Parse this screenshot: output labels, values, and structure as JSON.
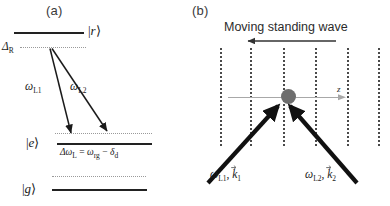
{
  "figure": {
    "width": 390,
    "height": 206,
    "background": "#ffffff"
  },
  "panel_a": {
    "label": "(a)",
    "levels": [
      {
        "name": "rydberg-level",
        "ket": "|r⟩",
        "ket_symbol": "r",
        "type": "solid"
      },
      {
        "name": "excited-level",
        "ket": "|e⟩",
        "ket_symbol": "e",
        "type": "solid"
      },
      {
        "name": "ground-level",
        "ket": "|g⟩",
        "ket_symbol": "g",
        "type": "solid"
      }
    ],
    "detuning_label": "Δ",
    "detuning_sub": "R",
    "laser1_label": "ω",
    "laser1_sub": "L1",
    "laser2_label": "ω",
    "laser2_sub": "L2",
    "two_photon_condition": "Δωʟ = ωᵣ₵ − δᵈ",
    "two_photon_parts": {
      "delta_omega": "Δω",
      "delta_omega_sub": "L",
      "equals": "=",
      "omega_rg": "ω",
      "omega_rg_sub": "rg",
      "minus": "−",
      "delta_d": "δ",
      "delta_d_sub": "d"
    },
    "colors": {
      "level_solid": "#222222",
      "level_dotted": "#9a9a9a",
      "arrow": "#1a1a1a"
    }
  },
  "panel_b": {
    "label": "(b)",
    "title": "Moving standing wave",
    "direction_arrow": "left",
    "axis_label": "z",
    "beam1_omega": "ω",
    "beam1_omega_sub": "L1",
    "beam1_k": "k",
    "beam1_k_sub": "1",
    "beam2_omega": "ω",
    "beam2_omega_sub": "L2",
    "beam2_k": "k",
    "beam2_k_sub": "2",
    "num_wave_nodes": 6,
    "colors": {
      "node_dots": "#4a4a4a",
      "atom": "#6e6e6e",
      "axis": "#a8a8a8",
      "beam": "#111111",
      "title_text": "#2b2b2b"
    }
  }
}
